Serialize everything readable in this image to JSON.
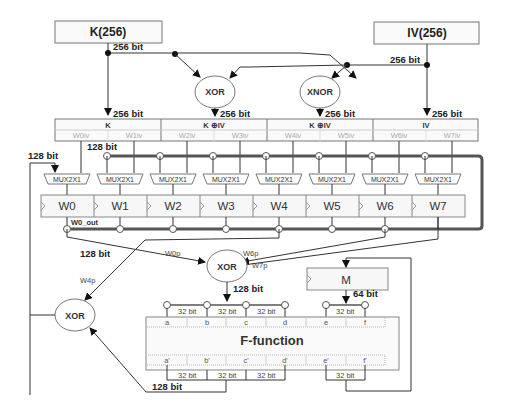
{
  "inputs": {
    "key": {
      "label": "K(256)"
    },
    "iv": {
      "label": "IV(256)"
    }
  },
  "gates": {
    "xor_top": "XOR",
    "xnor_top": "XNOR",
    "xor_mid": "XOR",
    "xor_left": "XOR"
  },
  "bit_labels": {
    "b256": "256 bit",
    "b128": "128 bit",
    "b64": "64 bit",
    "b32": "32 bit"
  },
  "init_groups": [
    {
      "title": "K",
      "subs": [
        "W0iv",
        "W1iv"
      ]
    },
    {
      "title": "K ⊕IV",
      "subs": [
        "W2iv",
        "W3iv"
      ]
    },
    {
      "title": "K ⊕IV",
      "subs": [
        "W4iv",
        "W5iv"
      ]
    },
    {
      "title": "IV",
      "subs": [
        "W6iv",
        "W7iv"
      ]
    }
  ],
  "mux_label": "MUX2X1",
  "registers": [
    "W0",
    "W1",
    "W2",
    "W3",
    "W4",
    "W5",
    "W6",
    "W7"
  ],
  "w0_out": "W0_out",
  "xor_inputs": {
    "w0p": "W0p",
    "w6p": "W6p",
    "w7p": "W7p",
    "w4p": "W4p"
  },
  "m_register": "M",
  "f_function": {
    "title": "F-function",
    "inputs": [
      "a",
      "b",
      "c",
      "d",
      "e",
      "f"
    ],
    "outputs": [
      "a'",
      "b'",
      "c'",
      "d'",
      "e'",
      "f'"
    ]
  }
}
